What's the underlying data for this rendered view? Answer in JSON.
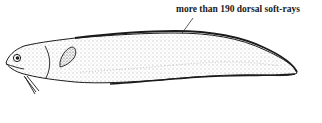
{
  "figure": {
    "annotation": "more than 190 dorsal soft-rays",
    "colors": {
      "ink": "#1a1a1a",
      "background": "#ffffff"
    }
  }
}
